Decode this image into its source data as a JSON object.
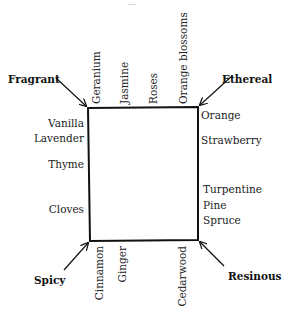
{
  "diagram": {
    "cutoff_top_text": "...",
    "corners": {
      "top_left": "Fragrant",
      "top_right": "Ethereal",
      "bottom_left": "Spicy",
      "bottom_right": "Resinous"
    },
    "top_edge": [
      "Geranium",
      "Jasmine",
      "Roses",
      "Orange blossoms"
    ],
    "left_edge": [
      "Vanilla",
      "Lavender",
      "Thyme",
      "Cloves"
    ],
    "right_edge": [
      "Orange",
      "Strawberry",
      "Turpentine",
      "Pine",
      "Spruce"
    ],
    "bottom_edge": [
      "Cinnamon",
      "Ginger",
      "Cedarwood"
    ],
    "colors": {
      "line": "#111111",
      "text": "#222222",
      "background": "#ffffff"
    }
  }
}
